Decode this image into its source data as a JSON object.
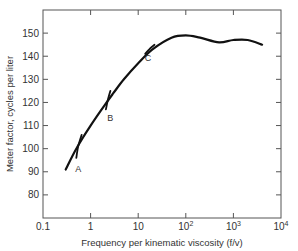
{
  "chart_data": {
    "type": "line",
    "title": "",
    "xlabel": "Frequency per kinematic viscosity (f/v)",
    "ylabel": "Meter factor, cycles per liter",
    "xscale": "log",
    "xlim": [
      0.1,
      10000
    ],
    "ylim": [
      70,
      160
    ],
    "x_ticks": [
      0.1,
      1,
      10,
      100,
      1000,
      10000
    ],
    "x_tick_labels": [
      "0.1",
      "1",
      "10",
      "10",
      "10",
      "10"
    ],
    "x_tick_exponents": [
      "",
      "",
      "",
      "2",
      "3",
      "4"
    ],
    "y_ticks": [
      80,
      90,
      100,
      110,
      120,
      130,
      140,
      150
    ],
    "y_tick_labels": [
      "80",
      "90",
      "100",
      "110",
      "120",
      "130",
      "140",
      "150"
    ],
    "grid": false,
    "legend": "none",
    "series": [
      {
        "name": "Universal curve",
        "x": [
          0.3,
          0.5,
          1,
          2,
          3,
          5,
          10,
          20,
          50,
          100,
          200,
          500,
          1000,
          2000,
          4000
        ],
        "y": [
          91,
          100,
          110,
          119,
          124,
          130,
          137,
          143,
          148,
          149,
          148,
          146,
          147,
          147,
          145
        ]
      },
      {
        "name": "A",
        "x": [
          0.5,
          0.55,
          0.65
        ],
        "y": [
          96,
          101,
          106
        ]
      },
      {
        "name": "B",
        "x": [
          2.1,
          2.3,
          2.6
        ],
        "y": [
          117,
          121,
          125
        ]
      },
      {
        "name": "C",
        "x": [
          14,
          17,
          22
        ],
        "y": [
          141,
          143,
          145
        ]
      }
    ],
    "annotations": [
      {
        "text": "A",
        "x": 0.55,
        "y": 90
      },
      {
        "text": "B",
        "x": 2.6,
        "y": 112
      },
      {
        "text": "C",
        "x": 16,
        "y": 138
      }
    ]
  }
}
